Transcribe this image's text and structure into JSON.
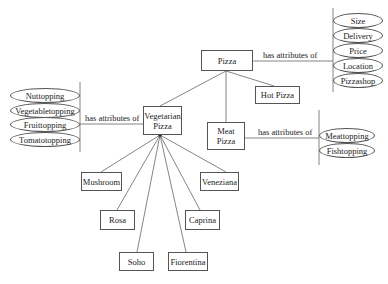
{
  "diagram": {
    "nodes": {
      "pizza": "Pizza",
      "hot_pizza": "Hot Pizza",
      "vegetarian_pizza_line1": "Vegetarian",
      "vegetarian_pizza_line2": "Pizza",
      "meat_pizza_line1": "Meat",
      "meat_pizza_line2": "Pizza",
      "mushroom": "Mushroom",
      "rosa": "Rosa",
      "soho": "Soho",
      "fiorentina": "Fiorentina",
      "caprina": "Caprina",
      "veneziana": "Veneziana"
    },
    "relations": {
      "pizza_attr": "has attributes of",
      "veg_attr": "has attributes of",
      "meat_attr": "has attributes of"
    },
    "pizza_attributes": [
      "Size",
      "Delivery",
      "Price",
      "Location",
      "Pizzashop"
    ],
    "vegetarian_attributes": [
      "Nuttopping",
      "Vegetabletopping",
      "Fruittopping",
      "Tomatotopping"
    ],
    "meat_attributes": [
      "Meattopping",
      "Fishtopping"
    ]
  }
}
